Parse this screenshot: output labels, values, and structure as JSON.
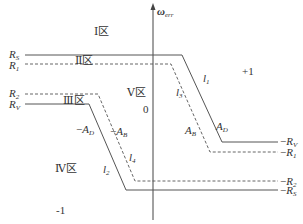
{
  "axis": {
    "label_main": "ω",
    "label_sub": "err",
    "origin_label": "0"
  },
  "zones": {
    "zone1": "Ⅰ区",
    "zone2": "Ⅱ区",
    "zone3": "Ⅲ区",
    "zone4": "Ⅳ区",
    "zone5": "Ⅴ区",
    "plus_one": "+1",
    "minus_one": "-1"
  },
  "left_labels": {
    "rs": {
      "main": "R",
      "sub": "S"
    },
    "r1": {
      "main": "R",
      "sub": "1"
    },
    "r2": {
      "main": "R",
      "sub": "2"
    },
    "rv": {
      "main": "R",
      "sub": "V"
    }
  },
  "right_labels": {
    "neg_rv": {
      "prefix": "−",
      "main": "R",
      "sub": "V"
    },
    "neg_r1": {
      "prefix": "−",
      "main": "R",
      "sub": "1"
    },
    "neg_r2": {
      "prefix": "−",
      "main": "R",
      "sub": "2"
    },
    "neg_rs": {
      "prefix": "−",
      "main": "R",
      "sub": "S"
    }
  },
  "line_labels": {
    "l1": {
      "main": "l",
      "sub": "1"
    },
    "l2": {
      "main": "l",
      "sub": "2"
    },
    "l3": {
      "main": "l",
      "sub": "3"
    },
    "l4": {
      "main": "l",
      "sub": "4"
    },
    "ad": {
      "main": "A",
      "sub": "D"
    },
    "ab": {
      "main": "A",
      "sub": "B"
    },
    "neg_ad": {
      "prefix": "−",
      "main": "A",
      "sub": "D"
    },
    "neg_ab": {
      "prefix": "−",
      "main": "A",
      "sub": "B"
    }
  },
  "colors": {
    "line": "#555555",
    "text": "#333333"
  }
}
